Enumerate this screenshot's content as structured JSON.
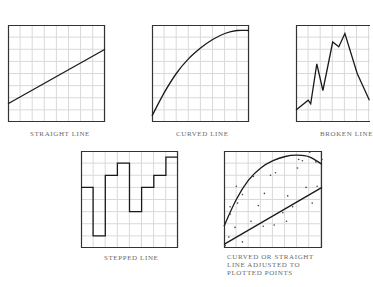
{
  "figure": {
    "panels": [
      {
        "id": "straight",
        "caption": "STRAIGHT LINE"
      },
      {
        "id": "curved",
        "caption": "CURVED LINE"
      },
      {
        "id": "broken",
        "caption": "BROKEN LINE"
      },
      {
        "id": "stepped",
        "caption": "STEPPED LINE"
      },
      {
        "id": "fitted",
        "caption_lines": [
          "CURVED OR STRAIGHT",
          "LINE ADJUSTED TO",
          "PLOTTED POINTS"
        ]
      }
    ],
    "colors": {
      "grid": "#d9d9d9",
      "frame": "#333333",
      "line": "#1a1a1a",
      "caption": "#6a6a6a"
    }
  },
  "chart_data": [
    {
      "type": "line",
      "title": "STRAIGHT LINE",
      "xlim": [
        0,
        8
      ],
      "ylim": [
        0,
        8
      ],
      "grid": true,
      "x": [
        0,
        8
      ],
      "values": [
        1.5,
        6.0
      ]
    },
    {
      "type": "line",
      "title": "CURVED LINE",
      "xlim": [
        0,
        8
      ],
      "ylim": [
        0,
        8
      ],
      "grid": true,
      "x": [
        0,
        1,
        2,
        3,
        4,
        5,
        6,
        7,
        8
      ],
      "values": [
        0.5,
        2.4,
        4.0,
        5.2,
        6.1,
        6.8,
        7.3,
        7.55,
        7.55
      ]
    },
    {
      "type": "line",
      "title": "BROKEN LINE",
      "xlim": [
        0,
        6
      ],
      "ylim": [
        0,
        8
      ],
      "grid": true,
      "x": [
        0,
        1,
        1.2,
        1.7,
        2.2,
        3.0,
        3.5,
        4.0,
        5.0,
        6.0
      ],
      "values": [
        1.0,
        1.8,
        1.5,
        4.8,
        2.6,
        6.6,
        6.2,
        7.3,
        4.0,
        1.8
      ]
    },
    {
      "type": "line",
      "title": "STEPPED LINE",
      "xlim": [
        0,
        8
      ],
      "ylim": [
        0,
        8
      ],
      "grid": true,
      "x": [
        0,
        1,
        2,
        3,
        4,
        5,
        6,
        7
      ],
      "values": [
        5,
        1,
        6,
        7,
        3,
        5,
        6,
        7.5
      ],
      "step": "post"
    },
    {
      "type": "scatter",
      "title": "CURVED OR STRAIGHT LINE ADJUSTED TO PLOTTED POINTS",
      "xlim": [
        0,
        8
      ],
      "ylim": [
        0,
        8
      ],
      "grid": true,
      "series": [
        {
          "name": "curved fit",
          "type": "line",
          "x": [
            0,
            1,
            2,
            3,
            4,
            5,
            6,
            7,
            8
          ],
          "values": [
            1.8,
            4.0,
            5.6,
            6.6,
            7.2,
            7.55,
            7.65,
            7.5,
            6.9
          ]
        },
        {
          "name": "straight fit",
          "type": "line",
          "x": [
            0,
            8
          ],
          "values": [
            0.3,
            5.0
          ]
        },
        {
          "name": "plotted points",
          "type": "scatter",
          "points": [
            [
              0.1,
              0.2
            ],
            [
              0.4,
              0.9
            ],
            [
              0.5,
              2.8
            ],
            [
              0.5,
              3.4
            ],
            [
              0.9,
              1.7
            ],
            [
              1.0,
              5.1
            ],
            [
              1.1,
              3.7
            ],
            [
              1.5,
              0.5
            ],
            [
              1.5,
              4.4
            ],
            [
              2.2,
              2.2
            ],
            [
              2.4,
              5.9
            ],
            [
              2.8,
              3.5
            ],
            [
              3.3,
              4.5
            ],
            [
              3.2,
              1.8
            ],
            [
              3.8,
              6.0
            ],
            [
              4.1,
              1.9
            ],
            [
              4.2,
              6.2
            ],
            [
              4.8,
              2.9
            ],
            [
              5.1,
              2.2
            ],
            [
              5.2,
              4.3
            ],
            [
              5.6,
              3.4
            ],
            [
              6.0,
              6.6
            ],
            [
              6.1,
              7.3
            ],
            [
              6.4,
              7.2
            ],
            [
              6.7,
              5.0
            ],
            [
              7.0,
              7.9
            ],
            [
              7.2,
              3.7
            ],
            [
              7.6,
              5.1
            ],
            [
              7.5,
              7.1
            ],
            [
              8.0,
              7.3
            ]
          ]
        }
      ]
    }
  ]
}
